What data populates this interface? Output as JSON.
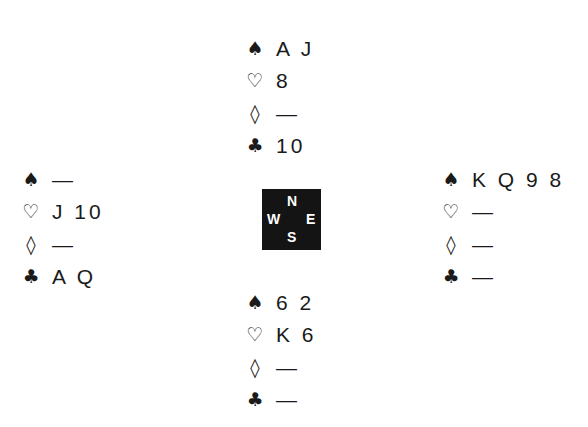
{
  "suits": {
    "spades": "♠",
    "hearts": "♡",
    "diamonds": "◊",
    "clubs": "♣"
  },
  "compass": {
    "north": "N",
    "south": "S",
    "west": "W",
    "east": "E"
  },
  "hands": {
    "north": {
      "spades": "A J",
      "hearts": "8",
      "diamonds": "—",
      "clubs": "10"
    },
    "west": {
      "spades": "—",
      "hearts": "J 10",
      "diamonds": "—",
      "clubs": "A Q"
    },
    "east": {
      "spades": "K Q 9 8",
      "hearts": "—",
      "diamonds": "—",
      "clubs": "—"
    },
    "south": {
      "spades": "6 2",
      "hearts": "K 6",
      "diamonds": "—",
      "clubs": "—"
    }
  }
}
